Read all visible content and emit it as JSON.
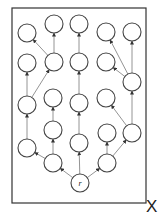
{
  "diagram": {
    "frame": {
      "x": 12,
      "y": 8,
      "width": 134,
      "height": 195,
      "stroke": "#333333"
    },
    "frame_label": "X",
    "node_radius": 9,
    "node_stroke": "#444444",
    "edge_color": "#888888",
    "arrow_color": "#333333",
    "nodes": [
      {
        "id": "r",
        "x": 80,
        "y": 183,
        "label": "r"
      },
      {
        "id": "a1",
        "x": 53,
        "y": 163,
        "label": ""
      },
      {
        "id": "a2",
        "x": 79,
        "y": 143,
        "label": ""
      },
      {
        "id": "a3",
        "x": 107,
        "y": 163,
        "label": ""
      },
      {
        "id": "b1",
        "x": 27,
        "y": 148,
        "label": ""
      },
      {
        "id": "b2",
        "x": 53,
        "y": 130,
        "label": ""
      },
      {
        "id": "b3",
        "x": 107,
        "y": 133,
        "label": ""
      },
      {
        "id": "b4",
        "x": 132,
        "y": 133,
        "label": ""
      },
      {
        "id": "c1",
        "x": 27,
        "y": 105,
        "label": ""
      },
      {
        "id": "c2",
        "x": 53,
        "y": 98,
        "label": ""
      },
      {
        "id": "c3",
        "x": 79,
        "y": 103,
        "label": ""
      },
      {
        "id": "c4",
        "x": 106,
        "y": 98,
        "label": ""
      },
      {
        "id": "c5",
        "x": 132,
        "y": 82,
        "label": ""
      },
      {
        "id": "d1",
        "x": 27,
        "y": 63,
        "label": ""
      },
      {
        "id": "d2",
        "x": 54,
        "y": 62,
        "label": ""
      },
      {
        "id": "d3",
        "x": 79,
        "y": 62,
        "label": ""
      },
      {
        "id": "d4",
        "x": 106,
        "y": 62,
        "label": ""
      },
      {
        "id": "e1",
        "x": 27,
        "y": 33,
        "label": ""
      },
      {
        "id": "e2",
        "x": 54,
        "y": 24,
        "label": ""
      },
      {
        "id": "e3",
        "x": 79,
        "y": 24,
        "label": ""
      },
      {
        "id": "e4",
        "x": 106,
        "y": 32,
        "label": ""
      },
      {
        "id": "e5",
        "x": 132,
        "y": 32,
        "label": ""
      }
    ],
    "edges": [
      {
        "from": "r",
        "to": "a1"
      },
      {
        "from": "r",
        "to": "a2"
      },
      {
        "from": "r",
        "to": "a3"
      },
      {
        "from": "a1",
        "to": "b1"
      },
      {
        "from": "a1",
        "to": "b2"
      },
      {
        "from": "a3",
        "to": "b3"
      },
      {
        "from": "a3",
        "to": "b4"
      },
      {
        "from": "b1",
        "to": "c1"
      },
      {
        "from": "b2",
        "to": "c2"
      },
      {
        "from": "a2",
        "to": "c3"
      },
      {
        "from": "b4",
        "to": "c4"
      },
      {
        "from": "b4",
        "to": "c5"
      },
      {
        "from": "c1",
        "to": "d1"
      },
      {
        "from": "c1",
        "to": "d2"
      },
      {
        "from": "c3",
        "to": "d3"
      },
      {
        "from": "c5",
        "to": "d4"
      },
      {
        "from": "d2",
        "to": "e1"
      },
      {
        "from": "d2",
        "to": "e2"
      },
      {
        "from": "d3",
        "to": "e3"
      },
      {
        "from": "c5",
        "to": "e4"
      },
      {
        "from": "c5",
        "to": "e5"
      }
    ]
  }
}
